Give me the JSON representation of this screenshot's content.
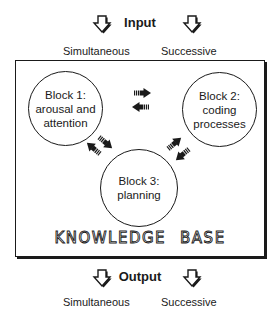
{
  "input": {
    "title": "Input",
    "labels": [
      "Simultaneous",
      "Successive"
    ],
    "arrow_icons": [
      "down-arrow-icon",
      "down-arrow-icon"
    ]
  },
  "blocks": [
    {
      "id": "block1",
      "lines": [
        "Block 1:",
        "arousal and",
        "attention"
      ]
    },
    {
      "id": "block2",
      "lines": [
        "Block 2:",
        "coding",
        "processes"
      ]
    },
    {
      "id": "block3",
      "lines": [
        "Block 3:",
        "planning"
      ]
    }
  ],
  "connections": [
    {
      "from": "block1",
      "to": "block2",
      "icon": "right-arrow-icon"
    },
    {
      "from": "block2",
      "to": "block1",
      "icon": "left-arrow-icon"
    },
    {
      "from": "block1",
      "to": "block3",
      "icon": "down-right-arrow-icon"
    },
    {
      "from": "block3",
      "to": "block1",
      "icon": "up-left-arrow-icon"
    },
    {
      "from": "block3",
      "to": "block2",
      "icon": "up-right-arrow-icon"
    },
    {
      "from": "block2",
      "to": "block3",
      "icon": "down-left-arrow-icon"
    }
  ],
  "knowledge_base": {
    "words": [
      "KNOWLEDGE",
      "BASE"
    ]
  },
  "output": {
    "title": "Output",
    "labels": [
      "Simultaneous",
      "Successive"
    ],
    "arrow_icons": [
      "down-arrow-icon",
      "down-arrow-icon"
    ]
  },
  "colors": {
    "ink": "#1a1a1a",
    "background": "#ffffff"
  }
}
